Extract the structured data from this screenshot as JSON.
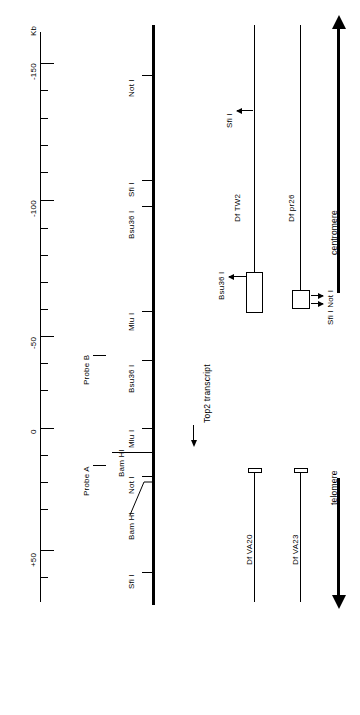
{
  "figure": {
    "units_label": "Kb"
  },
  "scale": {
    "label": "Kb",
    "major_ticks": [
      {
        "label": "-150",
        "kb": -150,
        "y": 63
      },
      {
        "label": "-100",
        "kb": -100,
        "y": 200
      },
      {
        "label": "-50",
        "kb": -50,
        "y": 336
      },
      {
        "label": "0",
        "kb": 0,
        "y": 428
      },
      {
        "label": "+50",
        "kb": 50,
        "y": 550
      }
    ],
    "minor_tick_ys": [
      90,
      118,
      145,
      172,
      228,
      255,
      282,
      309,
      363,
      390,
      400,
      455,
      482,
      509,
      523,
      577
    ],
    "axis_top_y": 32,
    "axis_bottom_y": 602
  },
  "restriction_sites": [
    {
      "label": "Not I",
      "y": 75
    },
    {
      "label": "Sfi I",
      "y": 180
    },
    {
      "label": "Bsu36 I",
      "y": 206
    },
    {
      "label": "Mlu I",
      "y": 311
    },
    {
      "label": "Bsu36 I",
      "y": 360
    },
    {
      "label": "Mlu I",
      "y": 428
    },
    {
      "label": "Bam HI",
      "y": 452
    },
    {
      "label": "Not I",
      "y": 476
    },
    {
      "label": "Bam HI",
      "y": 516
    },
    {
      "label": "Sfi I",
      "y": 572
    }
  ],
  "probes": [
    {
      "label": "Probe B",
      "y": 355
    },
    {
      "label": "Probe A",
      "y": 465
    }
  ],
  "transcript": {
    "label": "Top2 transcript"
  },
  "deficiencies": [
    {
      "label": "Df  TW2",
      "site_label": "Bsu36 I",
      "kind": "box-line"
    },
    {
      "label": "Df  pr26",
      "site_label": "Sfi I Not I",
      "kind": "square-line"
    },
    {
      "label": "Df  VA20",
      "site_label": "",
      "kind": "cap-line"
    },
    {
      "label": "Df  VA23",
      "site_label": "",
      "kind": "cap-line"
    }
  ],
  "deficiency_site_labels": {
    "tw2_sfi": "Sfi I"
  },
  "orientation": {
    "centromere": "centromere",
    "telomere": "telomere"
  }
}
